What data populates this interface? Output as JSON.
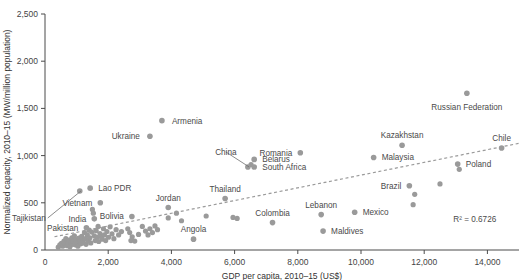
{
  "chart_data": {
    "type": "scatter",
    "title": "",
    "xlabel": "GDP per capita, 2010–15 (US$)",
    "ylabel": "Normalized capacity, 2010–15 (MW/million population)",
    "xlim": [
      0,
      15000
    ],
    "ylim": [
      0,
      2500
    ],
    "xticks": [
      0,
      2000,
      4000,
      6000,
      8000,
      10000,
      12000,
      14000
    ],
    "xtick_labels": [
      "0",
      "2,000",
      "4,000",
      "6,000",
      "8,000",
      "10,000",
      "12,000",
      "14,000"
    ],
    "yticks": [
      0,
      500,
      1000,
      1500,
      2000,
      2500
    ],
    "ytick_labels": [
      "0",
      "500",
      "1,000",
      "1,500",
      "2,000",
      "2,500"
    ],
    "grid": false,
    "legend": null,
    "annotations": [
      {
        "text": "R² = 0.6726",
        "x": 13600,
        "y": 300
      }
    ],
    "trendline": {
      "type": "linear",
      "style": "dashed",
      "x_start": 300,
      "y_start": 140,
      "x_end": 15000,
      "y_end": 1130
    },
    "marker_color": "#9a9a9a",
    "labeled_points": [
      {
        "label": "Armenia",
        "x": 3700,
        "y": 1370,
        "lx": 10,
        "ly": 3
      },
      {
        "label": "Ukraine",
        "x": 3320,
        "y": 1205,
        "lx": -10,
        "ly": 3,
        "anchor": "end"
      },
      {
        "label": "Russian Federation",
        "x": 13350,
        "y": 1660,
        "lx": 0,
        "ly": 17,
        "anchor": "middle"
      },
      {
        "label": "Chile",
        "x": 14450,
        "y": 1080,
        "lx": 0,
        "ly": -7,
        "anchor": "middle"
      },
      {
        "label": "Kazakhstan",
        "x": 11300,
        "y": 1110,
        "lx": 0,
        "ly": -7,
        "anchor": "middle"
      },
      {
        "label": "Poland",
        "x": 13060,
        "y": 910,
        "lx": 8,
        "ly": 3,
        "anchor": "start"
      },
      {
        "label": "Malaysia",
        "x": 10400,
        "y": 980,
        "lx": 8,
        "ly": 3,
        "anchor": "start"
      },
      {
        "label": "Romania",
        "x": 8080,
        "y": 1030,
        "lx": -8,
        "ly": 3,
        "anchor": "end"
      },
      {
        "label": "Belarus",
        "x": 6620,
        "y": 960,
        "lx": 8,
        "ly": 3,
        "anchor": "start"
      },
      {
        "label": "South Africa",
        "x": 6620,
        "y": 880,
        "lx": 8,
        "ly": 3,
        "anchor": "start"
      },
      {
        "label": "Brazil",
        "x": 11530,
        "y": 680,
        "lx": -8,
        "ly": 3,
        "anchor": "end"
      },
      {
        "label": "Thailand",
        "x": 5700,
        "y": 545,
        "lx": 0,
        "ly": -7,
        "anchor": "middle"
      },
      {
        "label": "Jordan",
        "x": 3900,
        "y": 450,
        "lx": 0,
        "ly": -7,
        "anchor": "middle"
      },
      {
        "label": "Lebanon",
        "x": 8740,
        "y": 375,
        "lx": 0,
        "ly": -7,
        "anchor": "middle"
      },
      {
        "label": "Mexico",
        "x": 9800,
        "y": 400,
        "lx": 8,
        "ly": 3,
        "anchor": "start"
      },
      {
        "label": "Colombia",
        "x": 7200,
        "y": 290,
        "lx": 0,
        "ly": -7,
        "anchor": "middle"
      },
      {
        "label": "Maldives",
        "x": 8800,
        "y": 200,
        "lx": 8,
        "ly": 3,
        "anchor": "start"
      },
      {
        "label": "Angola",
        "x": 4700,
        "y": 115,
        "lx": 0,
        "ly": -7,
        "anchor": "middle"
      },
      {
        "label": "China",
        "x": 6420,
        "y": 880,
        "lx": -22,
        "ly": -12,
        "anchor": "middle",
        "leader": true
      },
      {
        "label": "Lao PDR",
        "x": 1430,
        "y": 655,
        "lx": 8,
        "ly": 3,
        "anchor": "start"
      },
      {
        "label": "Tajikistan",
        "x": 1100,
        "y": 625,
        "lx": -34,
        "ly": 30,
        "anchor": "end",
        "leader": true
      },
      {
        "label": "Vietnam",
        "x": 1750,
        "y": 500,
        "lx": -8,
        "ly": 3,
        "anchor": "end"
      },
      {
        "label": "India",
        "x": 1560,
        "y": 330,
        "lx": -8,
        "ly": 3,
        "anchor": "end"
      },
      {
        "label": "Bolivia",
        "x": 2750,
        "y": 355,
        "lx": -8,
        "ly": 3,
        "anchor": "end"
      },
      {
        "label": "Pakistan",
        "x": 1310,
        "y": 235,
        "lx": -8,
        "ly": 3,
        "anchor": "end"
      }
    ],
    "unlabeled_points": [
      {
        "x": 420,
        "y": 30
      },
      {
        "x": 470,
        "y": 55
      },
      {
        "x": 520,
        "y": 70
      },
      {
        "x": 560,
        "y": 40
      },
      {
        "x": 600,
        "y": 95
      },
      {
        "x": 640,
        "y": 60
      },
      {
        "x": 660,
        "y": 120
      },
      {
        "x": 700,
        "y": 45
      },
      {
        "x": 720,
        "y": 85
      },
      {
        "x": 760,
        "y": 105
      },
      {
        "x": 790,
        "y": 35
      },
      {
        "x": 820,
        "y": 75
      },
      {
        "x": 850,
        "y": 130
      },
      {
        "x": 870,
        "y": 60
      },
      {
        "x": 900,
        "y": 95
      },
      {
        "x": 930,
        "y": 150
      },
      {
        "x": 960,
        "y": 55
      },
      {
        "x": 980,
        "y": 110
      },
      {
        "x": 1010,
        "y": 80
      },
      {
        "x": 1040,
        "y": 40
      },
      {
        "x": 1070,
        "y": 125
      },
      {
        "x": 1100,
        "y": 95
      },
      {
        "x": 1130,
        "y": 65
      },
      {
        "x": 1160,
        "y": 145
      },
      {
        "x": 1190,
        "y": 105
      },
      {
        "x": 1220,
        "y": 75
      },
      {
        "x": 1250,
        "y": 185
      },
      {
        "x": 1280,
        "y": 120
      },
      {
        "x": 1300,
        "y": 60
      },
      {
        "x": 1340,
        "y": 160
      },
      {
        "x": 1370,
        "y": 95
      },
      {
        "x": 1400,
        "y": 210
      },
      {
        "x": 1420,
        "y": 130
      },
      {
        "x": 1450,
        "y": 75
      },
      {
        "x": 1480,
        "y": 190
      },
      {
        "x": 1500,
        "y": 430
      },
      {
        "x": 1530,
        "y": 390
      },
      {
        "x": 1560,
        "y": 150
      },
      {
        "x": 1590,
        "y": 100
      },
      {
        "x": 1620,
        "y": 205
      },
      {
        "x": 1650,
        "y": 135
      },
      {
        "x": 1680,
        "y": 250
      },
      {
        "x": 1700,
        "y": 90
      },
      {
        "x": 1740,
        "y": 175
      },
      {
        "x": 1780,
        "y": 140
      },
      {
        "x": 1810,
        "y": 115
      },
      {
        "x": 1850,
        "y": 225
      },
      {
        "x": 1880,
        "y": 160
      },
      {
        "x": 1920,
        "y": 100
      },
      {
        "x": 1960,
        "y": 195
      },
      {
        "x": 2010,
        "y": 135
      },
      {
        "x": 2060,
        "y": 245
      },
      {
        "x": 2120,
        "y": 170
      },
      {
        "x": 2180,
        "y": 120
      },
      {
        "x": 2250,
        "y": 215
      },
      {
        "x": 2330,
        "y": 160
      },
      {
        "x": 2420,
        "y": 195
      },
      {
        "x": 2620,
        "y": 225
      },
      {
        "x": 2680,
        "y": 185
      },
      {
        "x": 2720,
        "y": 100
      },
      {
        "x": 2760,
        "y": 140
      },
      {
        "x": 2840,
        "y": 95
      },
      {
        "x": 2960,
        "y": 165
      },
      {
        "x": 3080,
        "y": 250
      },
      {
        "x": 3180,
        "y": 200
      },
      {
        "x": 3260,
        "y": 160
      },
      {
        "x": 3320,
        "y": 225
      },
      {
        "x": 3400,
        "y": 185
      },
      {
        "x": 3480,
        "y": 255
      },
      {
        "x": 3560,
        "y": 215
      },
      {
        "x": 3900,
        "y": 340
      },
      {
        "x": 4160,
        "y": 390
      },
      {
        "x": 4320,
        "y": 310
      },
      {
        "x": 5100,
        "y": 360
      },
      {
        "x": 5950,
        "y": 345
      },
      {
        "x": 6080,
        "y": 335
      },
      {
        "x": 6520,
        "y": 905
      },
      {
        "x": 12500,
        "y": 700
      },
      {
        "x": 11700,
        "y": 590
      },
      {
        "x": 11650,
        "y": 480
      },
      {
        "x": 13110,
        "y": 855
      }
    ]
  }
}
